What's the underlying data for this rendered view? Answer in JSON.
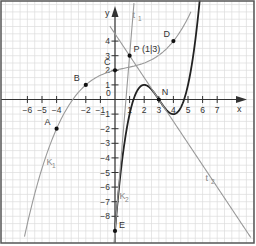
{
  "chart_data": {
    "type": "line",
    "title": "",
    "xlabel": "x",
    "ylabel": "y",
    "xlim": [
      -7.6,
      9.5
    ],
    "ylim": [
      -9.8,
      6.8
    ],
    "grid": true,
    "x_ticks": [
      -6,
      -5,
      -4,
      -2,
      -1,
      1,
      2,
      3,
      4,
      5,
      6,
      7
    ],
    "y_ticks": [
      4,
      3,
      2,
      1,
      -1,
      -2,
      -3,
      -4,
      -5,
      -6,
      -7,
      -8
    ],
    "origin_label": "0",
    "series": [
      {
        "name": "K1",
        "label": "K",
        "sub": "1",
        "color": "#9a9a9a",
        "expr": "x^3/32 - x^2/16 + x/4 + 2",
        "coef": [
          0.03125,
          -0.0625,
          0.25,
          2
        ],
        "domain": [
          -6.2,
          5.2
        ],
        "label_pos": [
          -4.7,
          -4.5
        ]
      },
      {
        "name": "K2",
        "label": "K",
        "sub": "2",
        "color": "#222222",
        "expr": "0.5(x-3)((x-3)^2-3)",
        "coef": [
          0.5,
          -4.5,
          12,
          -9
        ],
        "domain": [
          0,
          5.8
        ],
        "label_pos": [
          0.3,
          -6.8
        ]
      },
      {
        "name": "t1",
        "label": "t",
        "sub": "1",
        "color": "#9a9a9a",
        "expr": "12x - 9",
        "coef": [
          0,
          0,
          12,
          -9
        ],
        "domain": [
          -0.07,
          1.3
        ],
        "label_pos": [
          1.2,
          5.6
        ]
      },
      {
        "name": "t2",
        "label": "t",
        "sub": "2",
        "color": "#9a9a9a",
        "expr": "-1.5x + 4.5",
        "coef": [
          0,
          0,
          -1.5,
          4.5
        ],
        "domain": [
          -0.35,
          9.3
        ],
        "label_pos": [
          6.2,
          -5.6
        ]
      }
    ],
    "points": [
      {
        "name": "A",
        "x": -4,
        "y": -2,
        "label_dx": -12,
        "label_dy": -4
      },
      {
        "name": "B",
        "x": -2,
        "y": 1,
        "label_dx": -12,
        "label_dy": -4
      },
      {
        "name": "C",
        "x": 0,
        "y": 2,
        "label_dx": -11,
        "label_dy": -5
      },
      {
        "name": "P (1|3)",
        "x": 1,
        "y": 3,
        "label_dx": 4,
        "label_dy": -4
      },
      {
        "name": "D",
        "x": 4,
        "y": 4,
        "label_dx": -10,
        "label_dy": -4
      },
      {
        "name": "N",
        "x": 3,
        "y": 0,
        "label_dx": 3,
        "label_dy": -5
      },
      {
        "name": "E",
        "x": 0,
        "y": -9,
        "label_dx": 4,
        "label_dy": -3
      }
    ]
  },
  "layout": {
    "origin_px": [
      115,
      99.5
    ],
    "unit_px": 14.6,
    "frame": {
      "x": 1,
      "y": 1,
      "w": 253,
      "h": 242
    },
    "colors": {
      "grid": "#dcdcdc",
      "axis": "#333333",
      "frame": "#555555",
      "text": "#333333",
      "point": "#111111"
    }
  }
}
